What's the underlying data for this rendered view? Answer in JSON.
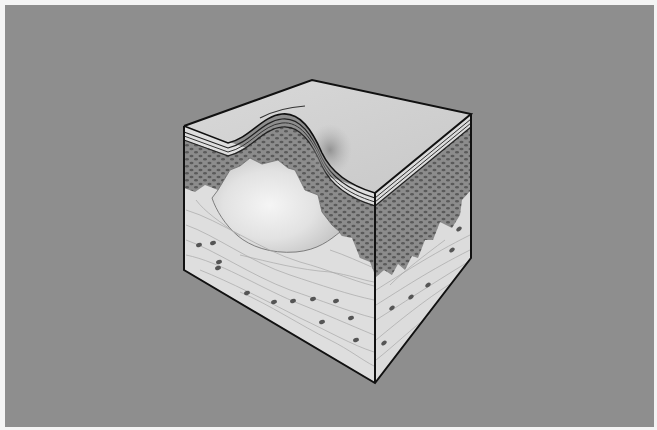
{
  "figure": {
    "layers": [
      {
        "name": "stratum-corneum",
        "color": "#c9c9c9"
      },
      {
        "name": "epidermis",
        "color": "#8a8a8a"
      },
      {
        "name": "dermis",
        "color": "#dcdcdc"
      },
      {
        "name": "blister-fluid",
        "color": "#f2f2f2"
      }
    ],
    "colors": {
      "background": "#8e8e8e",
      "border": "#f4f4f4",
      "top_surface": "#d2d2d2",
      "outline": "#111111",
      "cell_dots": "#555555"
    }
  }
}
